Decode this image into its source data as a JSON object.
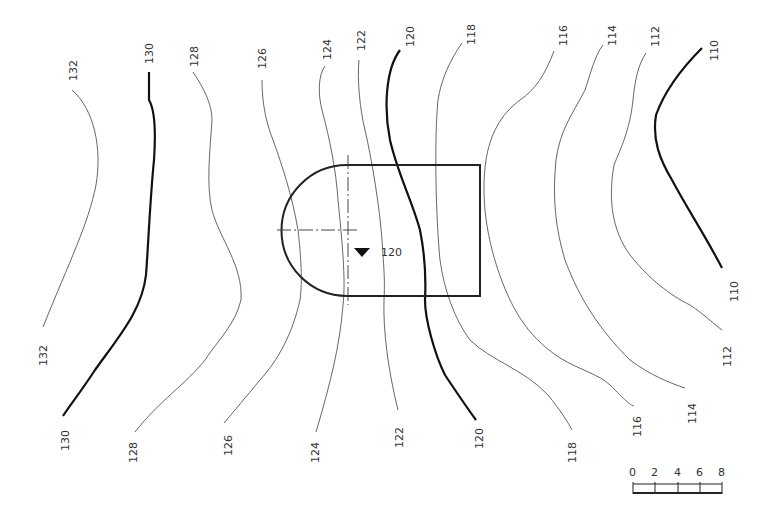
{
  "diagram": {
    "type": "contour site plan",
    "contour_interval": 2,
    "contours": [
      {
        "value": "132",
        "top_label": "132",
        "bottom_label": "132",
        "weight": "thin"
      },
      {
        "value": "130",
        "top_label": "130",
        "bottom_label": "130",
        "weight": "thick"
      },
      {
        "value": "128",
        "top_label": "128",
        "bottom_label": "128",
        "weight": "thin"
      },
      {
        "value": "126",
        "top_label": "126",
        "bottom_label": "126",
        "weight": "thin"
      },
      {
        "value": "124",
        "top_label": "124",
        "bottom_label": "124",
        "weight": "thin"
      },
      {
        "value": "122",
        "top_label": "122",
        "bottom_label": "122",
        "weight": "thin"
      },
      {
        "value": "120",
        "top_label": "120",
        "bottom_label": "120",
        "weight": "thick"
      },
      {
        "value": "118",
        "top_label": "118",
        "bottom_label": "118",
        "weight": "thin"
      },
      {
        "value": "116",
        "top_label": "116",
        "bottom_label": "116",
        "weight": "thin"
      },
      {
        "value": "114",
        "top_label": "114",
        "bottom_label": "114",
        "weight": "thin"
      },
      {
        "value": "112",
        "top_label": "112",
        "bottom_label": "112",
        "weight": "thin"
      },
      {
        "value": "110",
        "top_label": "110",
        "bottom_label": "110",
        "weight": "thick"
      }
    ],
    "building": {
      "shape": "semicircle-ended rectangle",
      "floor_elevation_marker": "▼",
      "floor_elevation": "120"
    },
    "scale_bar": {
      "ticks": [
        "0",
        "2",
        "4",
        "6",
        "8"
      ]
    }
  }
}
